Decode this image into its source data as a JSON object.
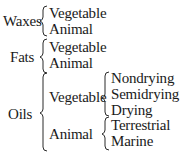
{
  "classification": {
    "groups": [
      {
        "label": "Waxes",
        "children": [
          {
            "label": "Vegetable"
          },
          {
            "label": "Animal"
          }
        ]
      },
      {
        "label": "Fats",
        "children": [
          {
            "label": "Vegetable"
          },
          {
            "label": "Animal"
          }
        ]
      },
      {
        "label": "Oils",
        "children": [
          {
            "label": "Vegetable",
            "children": [
              {
                "label": "Nondrying"
              },
              {
                "label": "Semidrying"
              },
              {
                "label": "Drying"
              }
            ]
          },
          {
            "label": "Animal",
            "children": [
              {
                "label": "Terrestrial"
              },
              {
                "label": "Marine"
              }
            ]
          }
        ]
      }
    ]
  }
}
